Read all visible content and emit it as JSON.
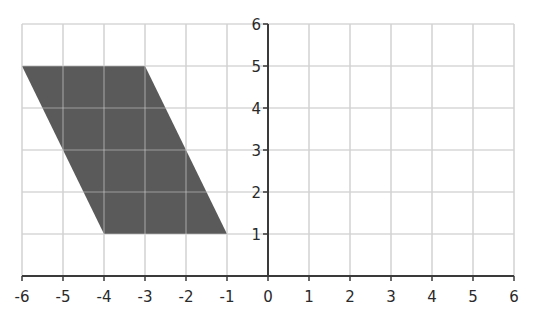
{
  "chart_data": {
    "type": "area",
    "title": "",
    "xlabel": "",
    "ylabel": "",
    "xlim": [
      -6,
      6
    ],
    "ylim": [
      0,
      6
    ],
    "grid": true,
    "x_ticks": [
      "-6",
      "-5",
      "-4",
      "-3",
      "-2",
      "-1",
      "0",
      "1",
      "2",
      "3",
      "4",
      "5",
      "6"
    ],
    "y_ticks": [
      "1",
      "2",
      "3",
      "4",
      "5",
      "6"
    ],
    "shapes": [
      {
        "name": "parallelogram",
        "fill": "#5a5a5a",
        "vertices": [
          [
            -6,
            5
          ],
          [
            -3,
            5
          ],
          [
            -1,
            1
          ],
          [
            -4,
            1
          ]
        ]
      }
    ]
  },
  "colors": {
    "grid": "#d2d2d2",
    "axis": "#3a3a3a",
    "shape": "#5a5a5a"
  }
}
